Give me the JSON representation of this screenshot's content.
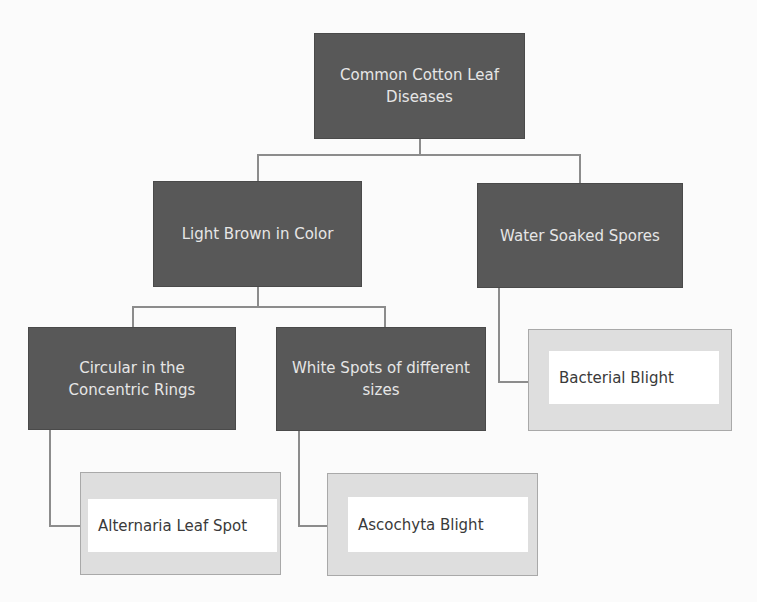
{
  "diagram": {
    "type": "tree",
    "root": {
      "label": "Common Cotton Leaf Diseases"
    },
    "level1": [
      {
        "label": "Light Brown in Color"
      },
      {
        "label": "Water Soaked Spores"
      }
    ],
    "level2": [
      {
        "label": "Circular in the Concentric Rings",
        "parent": "Light Brown in Color"
      },
      {
        "label": "White Spots of different sizes",
        "parent": "Light Brown in Color"
      }
    ],
    "leaves": [
      {
        "label": "Bacterial Blight",
        "parent": "Water Soaked Spores"
      },
      {
        "label": "Alternaria Leaf Spot",
        "parent": "Circular in the Concentric Rings"
      },
      {
        "label": "Ascochyta Blight",
        "parent": "White Spots of different sizes"
      }
    ]
  },
  "colors": {
    "dark_box": "#585858",
    "dark_text": "#e6e6e6",
    "leaf_frame": "#dedede",
    "leaf_inner": "#ffffff",
    "connector": "#8c8c8c"
  }
}
